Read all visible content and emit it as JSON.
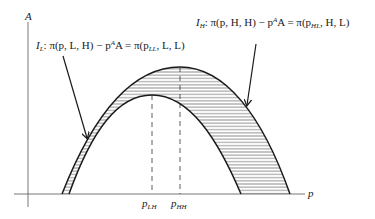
{
  "diagram": {
    "axes": {
      "y_label": "A",
      "x_label": "p"
    },
    "curves": [
      {
        "id": "I_L",
        "name": "I",
        "subscript": "L",
        "equation_lhs": "π(p, L, H) − p",
        "equation_sup": "A",
        "equation_mid": "A = π(p",
        "equation_sub": "LL",
        "equation_rhs": ", L, L)",
        "peak_label": "p",
        "peak_label_sub": "LH"
      },
      {
        "id": "I_H",
        "name": "I",
        "subscript": "H",
        "equation_lhs": "π(p, H, H) − p",
        "equation_sup": "A",
        "equation_mid": "A = π(p",
        "equation_sub": "HL",
        "equation_rhs": ", H, L)",
        "peak_label": "p",
        "peak_label_sub": "HH"
      }
    ],
    "colors": {
      "line": "#1a1a1a",
      "axis": "#555555",
      "hatch": "#444444",
      "background": "#ffffff"
    }
  }
}
